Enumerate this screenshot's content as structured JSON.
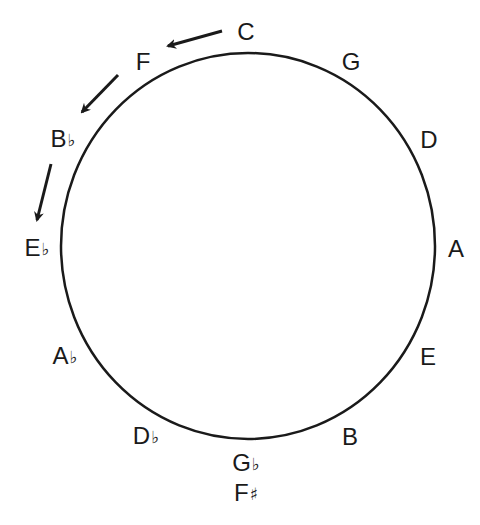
{
  "diagram": {
    "type": "circle-of-fifths",
    "stroke_color": "#1a1a1a",
    "circle": {
      "cx": 248,
      "cy": 246,
      "rx": 187,
      "ry": 193
    },
    "notes": [
      {
        "id": "C",
        "letter": "C",
        "accidental": "",
        "x": 246,
        "y": 32
      },
      {
        "id": "G",
        "letter": "G",
        "accidental": "",
        "x": 351,
        "y": 62
      },
      {
        "id": "D",
        "letter": "D",
        "accidental": "",
        "x": 429,
        "y": 140
      },
      {
        "id": "A",
        "letter": "A",
        "accidental": "",
        "x": 456,
        "y": 249
      },
      {
        "id": "E",
        "letter": "E",
        "accidental": "",
        "x": 428,
        "y": 357
      },
      {
        "id": "B",
        "letter": "B",
        "accidental": "",
        "x": 350,
        "y": 437
      },
      {
        "id": "Gb",
        "letter": "G",
        "accidental": "♭",
        "x": 246,
        "y": 464
      },
      {
        "id": "Fs",
        "letter": "F",
        "accidental": "♯",
        "x": 246,
        "y": 494
      },
      {
        "id": "Db",
        "letter": "D",
        "accidental": "♭",
        "x": 146,
        "y": 437
      },
      {
        "id": "Ab",
        "letter": "A",
        "accidental": "♭",
        "x": 65,
        "y": 357
      },
      {
        "id": "Eb",
        "letter": "E",
        "accidental": "♭",
        "x": 37,
        "y": 249
      },
      {
        "id": "Bb",
        "letter": "B",
        "accidental": "♭",
        "x": 63,
        "y": 140
      },
      {
        "id": "F",
        "letter": "F",
        "accidental": "",
        "x": 143,
        "y": 62
      }
    ],
    "arrows": [
      {
        "from": "C",
        "to": "F",
        "x1": 222,
        "y1": 31,
        "x2": 168,
        "y2": 46
      },
      {
        "from": "F",
        "to": "Bb",
        "x1": 118,
        "y1": 75,
        "x2": 82,
        "y2": 112
      },
      {
        "from": "Bb",
        "to": "Eb",
        "x1": 51,
        "y1": 164,
        "x2": 37,
        "y2": 220
      }
    ]
  }
}
